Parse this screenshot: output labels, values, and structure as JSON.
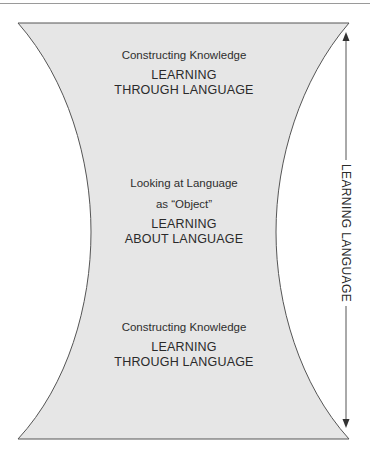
{
  "diagram": {
    "colors": {
      "fill": "#e6e6e6",
      "stroke": "#555555",
      "text": "#2a2a2a"
    },
    "top_section": {
      "subtitle": "Constructing Knowledge",
      "title_line1": "LEARNING",
      "title_line2": "THROUGH LANGUAGE"
    },
    "middle_section": {
      "subtitle_line1": "Looking at Language",
      "subtitle_line2": "as “Object”",
      "title_line1": "LEARNING",
      "title_line2": "ABOUT LANGUAGE"
    },
    "bottom_section": {
      "subtitle": "Constructing Knowledge",
      "title_line1": "LEARNING",
      "title_line2": "THROUGH LANGUAGE"
    },
    "side_axis": {
      "label": "LEARNING LANGUAGE",
      "direction": "bidirectional-vertical"
    }
  }
}
